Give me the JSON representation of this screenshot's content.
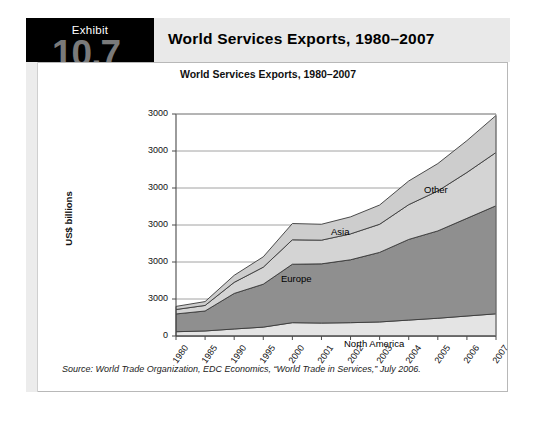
{
  "exhibit": {
    "tab_word": "Exhibit",
    "tab_number": "10.7",
    "header_title": "World Services Exports, 1980–2007",
    "source_note": "Source: World Trade Organization, EDC Economics, “World Trade in Services,” July 2006."
  },
  "chart_data": {
    "type": "area",
    "title": "World Services Exports, 1980–2007",
    "xlabel": "",
    "ylabel": "US$ billions",
    "stacked": true,
    "grid": true,
    "legend_position": "inline-labels",
    "categories": [
      "1980",
      "1985",
      "1990",
      "1995",
      "2000",
      "2001",
      "2002",
      "2003",
      "2004",
      "2005",
      "2006",
      "2007"
    ],
    "ylim": [
      0,
      3000
    ],
    "yticks": [
      0,
      500,
      1000,
      1500,
      2000,
      2500,
      3000
    ],
    "ytick_labels": [
      "0",
      "3000",
      "3000",
      "3000",
      "3000",
      "3000",
      "3000"
    ],
    "series": [
      {
        "name": "North America",
        "color": "#e4e4e4",
        "values": [
          58,
          68,
          95,
          120,
          180,
          175,
          180,
          190,
          215,
          240,
          270,
          300
        ]
      },
      {
        "name": "Europe",
        "color": "#8f8f8f",
        "values": [
          240,
          270,
          480,
          580,
          790,
          800,
          850,
          940,
          1090,
          1180,
          1320,
          1460
        ]
      },
      {
        "name": "Asia",
        "color": "#d4d4d4",
        "values": [
          60,
          75,
          150,
          230,
          330,
          320,
          350,
          380,
          470,
          540,
          620,
          720
        ]
      },
      {
        "name": "Other",
        "color": "#cdcdcd",
        "values": [
          42,
          52,
          95,
          140,
          220,
          215,
          230,
          260,
          320,
          370,
          430,
          500
        ]
      }
    ],
    "series_label_positions": [
      {
        "name": "North America",
        "x": 318,
        "y": 320
      },
      {
        "name": "Europe",
        "x": 255,
        "y": 255
      },
      {
        "name": "Asia",
        "x": 305,
        "y": 208
      },
      {
        "name": "Other",
        "x": 398,
        "y": 166
      }
    ]
  }
}
